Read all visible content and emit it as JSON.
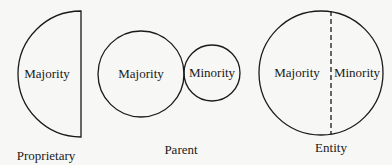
{
  "diagrams": [
    {
      "caption": "Proprietary",
      "regions": [
        "Majority"
      ]
    },
    {
      "caption": "Parent",
      "regions": [
        "Majority",
        "Minority"
      ]
    },
    {
      "caption": "Entity",
      "regions": [
        "Majority",
        "Minority"
      ]
    }
  ],
  "colors": {
    "stroke": "#1a1a1a",
    "background": "#f7f7f5"
  }
}
